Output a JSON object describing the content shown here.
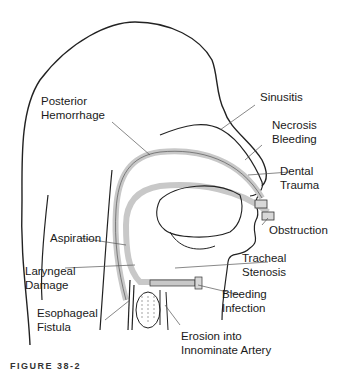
{
  "figure": {
    "caption": "FIGURE 38-2",
    "labels": {
      "posterior_hemorrhage": [
        "Posterior",
        "Hemorrhage"
      ],
      "sinusitis": [
        "Sinusitis"
      ],
      "necrosis_bleeding": [
        "Necrosis",
        "Bleeding"
      ],
      "dental_trauma": [
        "Dental",
        "Trauma"
      ],
      "obstruction": [
        "Obstruction"
      ],
      "aspiration": [
        "Aspiration"
      ],
      "laryngeal_damage": [
        "Laryngeal",
        "Damage"
      ],
      "tracheal_stenosis": [
        "Tracheal",
        "Stenosis"
      ],
      "bleeding_infection": [
        "Bleeding",
        "Infection"
      ],
      "esophageal_fistula": [
        "Esophageal",
        "Fistula"
      ],
      "erosion_innominate": [
        "Erosion into",
        "Innominate Artery"
      ]
    },
    "colors": {
      "outline": "#222222",
      "tube": "#c8c8c8",
      "leader": "#555555",
      "text": "#1a1a1a"
    }
  }
}
